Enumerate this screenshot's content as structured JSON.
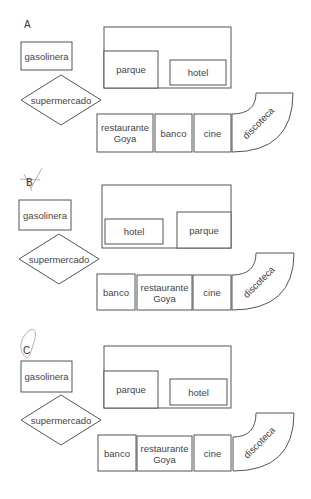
{
  "panels": [
    {
      "letter": "A",
      "letter_pos": [
        24,
        28
      ],
      "gasolinera": {
        "label": "gasolinera",
        "x": 21,
        "y": 42,
        "w": 51,
        "h": 28
      },
      "supermercado": {
        "label": "supermercado",
        "cx": 61,
        "cy": 100,
        "rx": 40,
        "ry": 25
      },
      "block": {
        "x": 104,
        "y": 27,
        "w": 127,
        "h": 61
      },
      "block_items": [
        {
          "label": "parque",
          "x": 104,
          "y": 51,
          "w": 54,
          "h": 37
        },
        {
          "label": "hotel",
          "x": 170,
          "y": 60,
          "w": 56,
          "h": 25
        }
      ],
      "row": [
        {
          "label": "restaurante",
          "label2": "Goya",
          "x": 97,
          "y": 114,
          "w": 56,
          "h": 38
        },
        {
          "label": "banco",
          "label2": "",
          "x": 155,
          "y": 114,
          "w": 37,
          "h": 38
        },
        {
          "label": "cine",
          "label2": "",
          "x": 194,
          "y": 114,
          "w": 37,
          "h": 38
        }
      ],
      "discoteca": {
        "label": "discoteca",
        "x": 232,
        "top": 93,
        "bottom": 152,
        "inner_y": 114,
        "inner_x": 256,
        "right": 293
      }
    },
    {
      "letter": "B",
      "letter_pos": [
        26,
        186
      ],
      "gasolinera": {
        "label": "gasolinera",
        "x": 19,
        "y": 200,
        "w": 52,
        "h": 30
      },
      "supermercado": {
        "label": "supermercado",
        "cx": 59,
        "cy": 259,
        "rx": 40,
        "ry": 25
      },
      "block": {
        "x": 102,
        "y": 185,
        "w": 129,
        "h": 63
      },
      "block_items": [
        {
          "label": "hotel",
          "x": 105,
          "y": 219,
          "w": 58,
          "h": 25
        },
        {
          "label": "parque",
          "x": 177,
          "y": 212,
          "w": 54,
          "h": 36
        }
      ],
      "row": [
        {
          "label": "banco",
          "label2": "",
          "x": 97,
          "y": 274,
          "w": 38,
          "h": 36
        },
        {
          "label": "restaurante",
          "label2": "Goya",
          "x": 137,
          "y": 275,
          "w": 55,
          "h": 35
        },
        {
          "label": "cine",
          "label2": "",
          "x": 193,
          "y": 275,
          "w": 38,
          "h": 35
        }
      ],
      "discoteca": {
        "label": "discoteca",
        "x": 232,
        "top": 253,
        "bottom": 310,
        "inner_y": 275,
        "inner_x": 256,
        "right": 294
      }
    },
    {
      "letter": "C",
      "letter_pos": [
        23,
        354
      ],
      "gasolinera": {
        "label": "gasolinera",
        "x": 21,
        "y": 361,
        "w": 51,
        "h": 31
      },
      "supermercado": {
        "label": "supermercado",
        "cx": 61,
        "cy": 420,
        "rx": 40,
        "ry": 25
      },
      "block": {
        "x": 104,
        "y": 346,
        "w": 127,
        "h": 62
      },
      "block_items": [
        {
          "label": "parque",
          "x": 104,
          "y": 371,
          "w": 54,
          "h": 37
        },
        {
          "label": "hotel",
          "x": 170,
          "y": 379,
          "w": 57,
          "h": 26
        }
      ],
      "row": [
        {
          "label": "banco",
          "label2": "",
          "x": 98,
          "y": 435,
          "w": 38,
          "h": 36
        },
        {
          "label": "restaurante",
          "label2": "Goya",
          "x": 137,
          "y": 436,
          "w": 55,
          "h": 35
        },
        {
          "label": "cine",
          "label2": "",
          "x": 194,
          "y": 435,
          "w": 37,
          "h": 36
        }
      ],
      "discoteca": {
        "label": "discoteca",
        "x": 233,
        "top": 413,
        "bottom": 471,
        "inner_y": 437,
        "inner_x": 256,
        "right": 294
      }
    }
  ]
}
